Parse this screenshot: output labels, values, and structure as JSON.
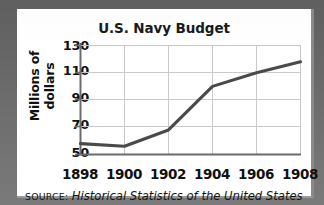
{
  "chart_data": {
    "type": "line",
    "title": "U.S. Navy Budget",
    "xlabel": "",
    "ylabel": "Millions of dollars",
    "x": [
      1898,
      1900,
      1902,
      1904,
      1906,
      1908
    ],
    "values": [
      58,
      56,
      68,
      100,
      110,
      118
    ],
    "series": [
      {
        "name": "U.S. Navy Budget",
        "values": [
          58,
          56,
          68,
          100,
          110,
          118
        ]
      }
    ],
    "xtick_labels": [
      "1898",
      "1900",
      "1902",
      "1904",
      "1906",
      "1908"
    ],
    "ytick_labels": [
      "130",
      "110",
      "90",
      "70",
      "50"
    ],
    "yticks": [
      130,
      110,
      90,
      70,
      50
    ],
    "xlim": [
      1898,
      1908
    ],
    "ylim": [
      50,
      130
    ],
    "grid": true,
    "legend": false,
    "line_color": "#4a4a4a",
    "grid_color": "#c9c9c9",
    "axis_color": "#6b6b6b"
  },
  "source": {
    "keyword": "SOURCE:",
    "title": "Historical Statistics of the United States"
  },
  "frame": {
    "background_color": "#6e6e6e",
    "card_color": "#ffffff"
  }
}
